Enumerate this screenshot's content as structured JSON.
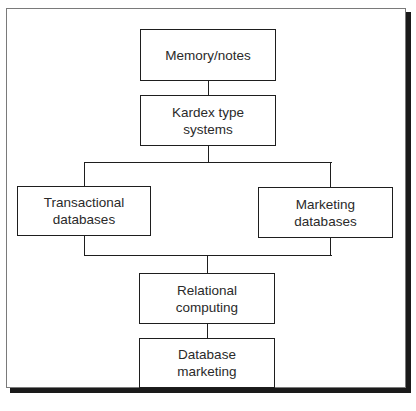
{
  "diagram": {
    "type": "flowchart",
    "nodes": [
      {
        "id": "memory",
        "label": "Memory/notes"
      },
      {
        "id": "kardex",
        "label": "Kardex type\nsystems"
      },
      {
        "id": "transactional",
        "label": "Transactional\ndatabases"
      },
      {
        "id": "marketing",
        "label": "Marketing\ndatabases"
      },
      {
        "id": "relational",
        "label": "Relational\ncomputing"
      },
      {
        "id": "dbmarketing",
        "label": "Database\nmarketing"
      }
    ],
    "edges": [
      {
        "from": "memory",
        "to": "kardex"
      },
      {
        "from": "kardex",
        "to": "transactional"
      },
      {
        "from": "kardex",
        "to": "marketing"
      },
      {
        "from": "transactional",
        "to": "relational"
      },
      {
        "from": "marketing",
        "to": "relational"
      },
      {
        "from": "relational",
        "to": "dbmarketing"
      }
    ],
    "colors": {
      "line": "#1e1e1e",
      "text": "#2a2a2a",
      "background": "#ffffff",
      "shadow": "#1a1a1a"
    }
  }
}
